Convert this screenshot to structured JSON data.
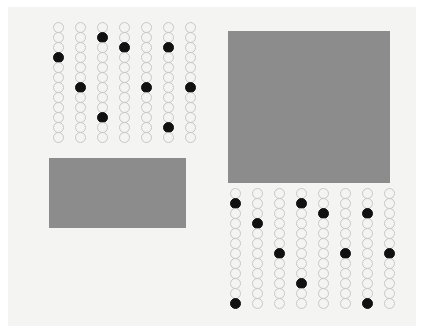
{
  "figure": {
    "title": "Abstract dot grid and rectangle composition",
    "width": 424,
    "height": 333,
    "background_color": "#ffffff",
    "canvas_color": "#f4f4f2",
    "canvas": {
      "x": 8,
      "y": 7,
      "width": 408,
      "height": 319
    }
  },
  "style": {
    "dot_outline_color": "#c8c8c8",
    "dot_fill_color": "#111111",
    "dot_empty_color": "transparent",
    "rectangle_color": "#8c8c8c",
    "dot_diameter": 11,
    "dot_border_width": 1.4,
    "dot_row_spacing": 10,
    "dot_column_spacing": 22
  },
  "chart_data": {
    "type": "scatter",
    "title": "Abstract dot grid and rectangle composition",
    "xlabel": "",
    "ylabel": "",
    "grid": false,
    "legend": "none",
    "groups": [
      {
        "name": "top-left-dot-grid",
        "columns": 7,
        "rows": 12,
        "x": 47,
        "y": 22,
        "filled_cells": [
          {
            "column": 1,
            "row": 4
          },
          {
            "column": 2,
            "row": 7
          },
          {
            "column": 3,
            "row": 2
          },
          {
            "column": 3,
            "row": 10
          },
          {
            "column": 4,
            "row": 3
          },
          {
            "column": 5,
            "row": 7
          },
          {
            "column": 6,
            "row": 3
          },
          {
            "column": 6,
            "row": 11
          },
          {
            "column": 7,
            "row": 7
          }
        ],
        "filled_count": 9,
        "total_count": 84
      },
      {
        "name": "bottom-right-dot-grid",
        "columns": 8,
        "rows": 12,
        "x": 224,
        "y": 188,
        "filled_cells": [
          {
            "column": 1,
            "row": 2
          },
          {
            "column": 1,
            "row": 12
          },
          {
            "column": 2,
            "row": 4
          },
          {
            "column": 3,
            "row": 7
          },
          {
            "column": 4,
            "row": 2
          },
          {
            "column": 4,
            "row": 10
          },
          {
            "column": 5,
            "row": 3
          },
          {
            "column": 6,
            "row": 7
          },
          {
            "column": 7,
            "row": 3
          },
          {
            "column": 7,
            "row": 12
          },
          {
            "column": 8,
            "row": 7
          }
        ],
        "filled_count": 11,
        "total_count": 96
      }
    ],
    "rectangles": [
      {
        "name": "left-gray-rectangle",
        "x": 49,
        "y": 158,
        "width": 137,
        "height": 70,
        "color": "#8c8c8c"
      },
      {
        "name": "right-gray-square",
        "x": 228,
        "y": 31,
        "width": 162,
        "height": 152,
        "color": "#8c8c8c"
      }
    ]
  }
}
